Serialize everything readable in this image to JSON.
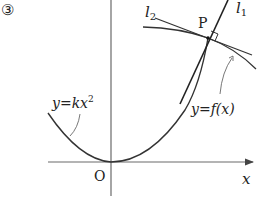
{
  "figure": {
    "number_label": "③",
    "origin_label": "O",
    "x_axis_label": "x",
    "point_label": "P",
    "line1_label": {
      "base": "l",
      "sub": "1"
    },
    "line2_label": {
      "base": "l",
      "sub": "2"
    },
    "curve_f_label": "y=f(x)",
    "curve_k_label": {
      "base": "y=kx",
      "sup": "2"
    }
  },
  "colors": {
    "axis": "#6a6a6a",
    "curve": "#333333",
    "text": "#222222"
  }
}
